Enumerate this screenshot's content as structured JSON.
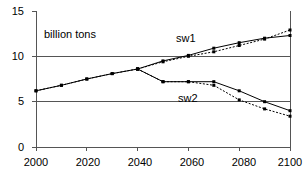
{
  "chart_data": {
    "type": "line",
    "title": "",
    "subtitle": "",
    "xlabel": "",
    "ylabel": "",
    "annotation": "billion tons",
    "xlim": [
      2000,
      2100
    ],
    "ylim": [
      0,
      15
    ],
    "xticks": [
      2000,
      2020,
      2040,
      2060,
      2080,
      2100
    ],
    "xtick_labels": [
      "2000",
      "2020",
      "2040",
      "2060",
      "2080",
      "2100"
    ],
    "yticks": [
      0,
      5,
      10,
      15
    ],
    "ytick_labels": [
      "0",
      "5",
      "10",
      "15"
    ],
    "gridlines": [
      5,
      10
    ],
    "grid": true,
    "legend_position": "inline-labels",
    "series": [
      {
        "name": "sw1",
        "label": "sw1",
        "style": "solid",
        "marker": "square",
        "color": "#000000",
        "x": [
          2000,
          2010,
          2020,
          2030,
          2040,
          2050,
          2060,
          2070,
          2080,
          2090,
          2100
        ],
        "values": [
          6.2,
          6.8,
          7.5,
          8.1,
          8.6,
          9.5,
          10.1,
          10.9,
          11.5,
          12.0,
          12.3
        ]
      },
      {
        "name": "sw1-alt",
        "label": "sw1",
        "style": "dashed",
        "marker": "square",
        "color": "#000000",
        "x": [
          2000,
          2010,
          2020,
          2030,
          2040,
          2050,
          2060,
          2070,
          2080,
          2090,
          2100
        ],
        "values": [
          6.2,
          6.8,
          7.5,
          8.1,
          8.6,
          9.4,
          10.0,
          10.5,
          11.2,
          11.9,
          12.9
        ]
      },
      {
        "name": "sw2",
        "label": "sw2",
        "style": "solid",
        "marker": "square",
        "color": "#000000",
        "x": [
          2040,
          2050,
          2060,
          2070,
          2080,
          2090,
          2100
        ],
        "values": [
          8.6,
          7.2,
          7.2,
          7.2,
          6.2,
          5.0,
          4.0
        ]
      },
      {
        "name": "sw2-alt",
        "label": "sw2",
        "style": "dashed",
        "marker": "square",
        "color": "#000000",
        "x": [
          2040,
          2050,
          2060,
          2070,
          2080,
          2090,
          2100
        ],
        "values": [
          8.6,
          7.2,
          7.2,
          6.8,
          5.2,
          4.2,
          3.4
        ]
      }
    ],
    "series_labels": [
      {
        "text": "sw1",
        "x": 2060,
        "y": 11.6
      },
      {
        "text": "sw2",
        "x": 2062,
        "y": 6.2
      }
    ]
  },
  "axis": {
    "y_tick_0": "0",
    "y_tick_5": "5",
    "y_tick_10": "10",
    "y_tick_15": "15",
    "x_tick_2000": "2000",
    "x_tick_2020": "2020",
    "x_tick_2040": "2040",
    "x_tick_2060": "2060",
    "x_tick_2080": "2080",
    "x_tick_2100": "2100"
  },
  "labels": {
    "units": "billion tons",
    "series_sw1": "sw1",
    "series_sw2": "sw2"
  }
}
